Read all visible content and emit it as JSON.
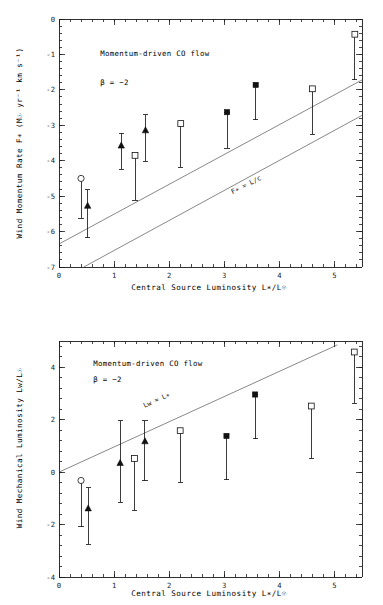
{
  "figure": {
    "title": "",
    "background": "#ffffff",
    "marker_color": "#111111",
    "refline_color": "#555555"
  },
  "chart_data": [
    {
      "type": "scatter",
      "panel": "top",
      "title": "",
      "xlabel": "Central Source Luminosity L∗/L☉",
      "ylabel": "Wind Momentum Rate F∗ (M☉ yr⁻¹ km s⁻¹)",
      "xlim": [
        0,
        5.5
      ],
      "ylim": [
        -7,
        0
      ],
      "xticks": [
        0,
        1,
        2,
        3,
        4,
        5
      ],
      "yticks": [
        0,
        -1,
        -2,
        -3,
        -4,
        -5,
        -6,
        -7
      ],
      "xtick_labels": [
        "0",
        "1",
        "2",
        "3",
        "4",
        "5"
      ],
      "ytick_labels": [
        "0",
        "-1",
        "-2",
        "-3",
        "-4",
        "-5",
        "-6",
        "-7"
      ],
      "grid": false,
      "legend": "none",
      "annotations": [
        {
          "text": "Momentum-driven CO flow",
          "x": 0.75,
          "y": -1.05
        },
        {
          "text": "β = −2",
          "x": 0.75,
          "y": -1.85
        },
        {
          "text": "F∗ = L/c",
          "x": 3.15,
          "y": -4.95,
          "rotation": -27
        }
      ],
      "reference_lines": [
        {
          "label": "upper",
          "x0": 0.0,
          "y0": -6.35,
          "x1": 5.5,
          "y1": -1.72
        },
        {
          "label": "F* = L/c",
          "x0": 0.45,
          "y0": -7.0,
          "x1": 5.5,
          "y1": -2.72
        }
      ],
      "points": [
        {
          "x": 0.4,
          "y": -4.5,
          "marker": "open-circle",
          "yerr_low": -5.62,
          "yerr_high": -4.5
        },
        {
          "x": 0.52,
          "y": -5.27,
          "marker": "filled-triangle",
          "yerr_low": -6.17,
          "yerr_high": -4.82
        },
        {
          "x": 1.13,
          "y": -3.57,
          "marker": "filled-triangle",
          "yerr_low": -4.24,
          "yerr_high": -3.23
        },
        {
          "x": 1.38,
          "y": -3.85,
          "marker": "open-square",
          "yerr_low": -5.12,
          "yerr_high": -3.85
        },
        {
          "x": 1.57,
          "y": -3.14,
          "marker": "filled-triangle",
          "yerr_low": -4.02,
          "yerr_high": -2.7
        },
        {
          "x": 2.21,
          "y": -2.95,
          "marker": "open-square",
          "yerr_low": -4.18,
          "yerr_high": -2.95
        },
        {
          "x": 3.05,
          "y": -2.63,
          "marker": "filled-square",
          "yerr_low": -3.65,
          "yerr_high": -2.63
        },
        {
          "x": 3.57,
          "y": -1.86,
          "marker": "filled-square",
          "yerr_low": -2.85,
          "yerr_high": -1.86
        },
        {
          "x": 4.6,
          "y": -1.97,
          "marker": "open-square",
          "yerr_low": -3.25,
          "yerr_high": -1.97
        },
        {
          "x": 5.37,
          "y": -0.43,
          "marker": "open-square",
          "yerr_low": -1.72,
          "yerr_high": -0.43
        }
      ]
    },
    {
      "type": "scatter",
      "panel": "bottom",
      "title": "",
      "xlabel": "Central Source Luminosity L∗/L☉",
      "ylabel": "Wind Mechanical Luminosity Lᴡ/L☉",
      "xlim": [
        0,
        5.5
      ],
      "ylim": [
        -4,
        5
      ],
      "xticks": [
        0,
        1,
        2,
        3,
        4,
        5
      ],
      "yticks": [
        4,
        2,
        0,
        -2,
        -4
      ],
      "xtick_labels": [
        "0",
        "1",
        "2",
        "3",
        "4",
        "5"
      ],
      "ytick_labels": [
        "4",
        "2",
        "0",
        "-2",
        "-4"
      ],
      "grid": false,
      "legend": "none",
      "annotations": [
        {
          "text": "Momentum-driven CO flow",
          "x": 0.62,
          "y": 4.05
        },
        {
          "text": "β = −2",
          "x": 0.62,
          "y": 3.45
        },
        {
          "text": "Lᴡ = L∗",
          "x": 1.55,
          "y": 2.45,
          "rotation": -24
        }
      ],
      "reference_lines": [
        {
          "label": "Lw = L*",
          "x0": 0.0,
          "y0": 0.0,
          "x1": 5.05,
          "y1": 4.85
        }
      ],
      "points": [
        {
          "x": 0.4,
          "y": -0.32,
          "marker": "open-circle",
          "yerr_low": -2.08,
          "yerr_high": -0.32
        },
        {
          "x": 0.53,
          "y": -1.38,
          "marker": "filled-triangle",
          "yerr_low": -2.75,
          "yerr_high": -0.6
        },
        {
          "x": 1.11,
          "y": 0.35,
          "marker": "filled-triangle",
          "yerr_low": -1.15,
          "yerr_high": 1.95
        },
        {
          "x": 1.37,
          "y": 0.52,
          "marker": "open-square",
          "yerr_low": -1.45,
          "yerr_high": 0.52
        },
        {
          "x": 1.56,
          "y": 1.18,
          "marker": "filled-triangle",
          "yerr_low": -0.33,
          "yerr_high": 1.95
        },
        {
          "x": 2.2,
          "y": 1.58,
          "marker": "open-square",
          "yerr_low": -0.38,
          "yerr_high": 1.58
        },
        {
          "x": 3.04,
          "y": 1.38,
          "marker": "filled-square",
          "yerr_low": -0.3,
          "yerr_high": 1.38
        },
        {
          "x": 3.56,
          "y": 2.96,
          "marker": "filled-square",
          "yerr_low": 1.28,
          "yerr_high": 2.96
        },
        {
          "x": 4.58,
          "y": 2.52,
          "marker": "open-square",
          "yerr_low": 0.52,
          "yerr_high": 2.52
        },
        {
          "x": 5.36,
          "y": 4.58,
          "marker": "open-square",
          "yerr_low": 2.62,
          "yerr_high": 4.58
        }
      ]
    }
  ]
}
